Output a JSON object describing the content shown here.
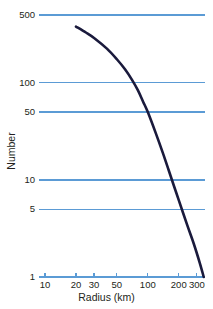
{
  "chart_data": {
    "type": "line",
    "title": "",
    "xlabel": "Radius (km)",
    "ylabel": "Number",
    "xscale": "log",
    "yscale": "log",
    "xlim": [
      10,
      360
    ],
    "ylim": [
      1,
      500
    ],
    "grid": true,
    "grid_axis": "y",
    "grid_color": "#5b9bd5",
    "legend": null,
    "xticks": [
      {
        "value": 10,
        "label": "10"
      },
      {
        "value": 20,
        "label": "20"
      },
      {
        "value": 30,
        "label": "30"
      },
      {
        "value": 50,
        "label": "50"
      },
      {
        "value": 100,
        "label": "100"
      },
      {
        "value": 200,
        "label": "200"
      },
      {
        "value": 300,
        "label": "300"
      }
    ],
    "yticks": [
      {
        "value": 1,
        "label": "1"
      },
      {
        "value": 5,
        "label": "5"
      },
      {
        "value": 10,
        "label": "10"
      },
      {
        "value": 50,
        "label": "50"
      },
      {
        "value": 100,
        "label": "100"
      },
      {
        "value": 500,
        "label": "500"
      }
    ],
    "series": [
      {
        "name": "cumulative-number",
        "color": "#1a1a3c",
        "linewidth": 2.6,
        "x": [
          20,
          25,
          30,
          40,
          50,
          60,
          70,
          80,
          90,
          100,
          120,
          140,
          160,
          180,
          200,
          240,
          280,
          320,
          350
        ],
        "y": [
          380,
          330,
          290,
          225,
          175,
          138,
          108,
          84,
          64,
          50,
          30,
          19,
          12.5,
          8.6,
          6.2,
          3.5,
          2.2,
          1.4,
          1.0
        ]
      }
    ]
  },
  "axes": {
    "x_title": "Radius (km)",
    "y_title": "Number"
  }
}
